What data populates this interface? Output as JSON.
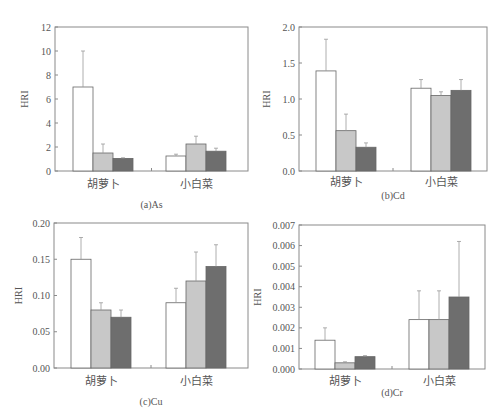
{
  "colors": {
    "series": [
      "#ffffff",
      "#c8c8c8",
      "#6e6e6e"
    ],
    "stroke": "#666666",
    "error": "#999999"
  },
  "chart_data": [
    {
      "type": "bar",
      "title": "(a)As",
      "ylabel": "HRI",
      "xlabel": "",
      "categories": [
        "胡萝卜",
        "小白菜"
      ],
      "ylim": [
        0,
        12
      ],
      "yticks": [
        0,
        2,
        4,
        6,
        8,
        10,
        12
      ],
      "ytick_labels": [
        "0",
        "2",
        "4",
        "6",
        "8",
        "10",
        "12"
      ],
      "series": [
        {
          "name": "series-1",
          "values": [
            7.0,
            1.25
          ],
          "errors": [
            3.0,
            0.15
          ]
        },
        {
          "name": "series-2",
          "values": [
            1.5,
            2.25
          ],
          "errors": [
            0.75,
            0.65
          ]
        },
        {
          "name": "series-3",
          "values": [
            1.05,
            1.65
          ],
          "errors": [
            0.05,
            0.25
          ]
        }
      ],
      "legend": null,
      "grid": false
    },
    {
      "type": "bar",
      "title": "(b)Cd",
      "ylabel": "HRI",
      "xlabel": "",
      "categories": [
        "胡萝卜",
        "小白菜"
      ],
      "ylim": [
        0,
        2.0
      ],
      "yticks": [
        0,
        0.5,
        1.0,
        1.5,
        2.0
      ],
      "ytick_labels": [
        "0.0",
        "0.5",
        "1.0",
        "1.5",
        "2.0"
      ],
      "series": [
        {
          "name": "series-1",
          "values": [
            1.39,
            1.15
          ],
          "errors": [
            0.44,
            0.12
          ]
        },
        {
          "name": "series-2",
          "values": [
            0.56,
            1.05
          ],
          "errors": [
            0.23,
            0.05
          ]
        },
        {
          "name": "series-3",
          "values": [
            0.33,
            1.12
          ],
          "errors": [
            0.06,
            0.15
          ]
        }
      ],
      "legend": null,
      "grid": false
    },
    {
      "type": "bar",
      "title": "(c)Cu",
      "ylabel": "HRI",
      "xlabel": "",
      "categories": [
        "胡萝卜",
        "小白菜"
      ],
      "ylim": [
        0,
        0.2
      ],
      "yticks": [
        0,
        0.05,
        0.1,
        0.15,
        0.2
      ],
      "ytick_labels": [
        "0.00",
        "0.05",
        "0.10",
        "0.15",
        "0.20"
      ],
      "series": [
        {
          "name": "series-1",
          "values": [
            0.15,
            0.09
          ],
          "errors": [
            0.03,
            0.02
          ]
        },
        {
          "name": "series-2",
          "values": [
            0.08,
            0.12
          ],
          "errors": [
            0.01,
            0.04
          ]
        },
        {
          "name": "series-3",
          "values": [
            0.07,
            0.14
          ],
          "errors": [
            0.01,
            0.03
          ]
        }
      ],
      "legend": null,
      "grid": false
    },
    {
      "type": "bar",
      "title": "(d)Cr",
      "ylabel": "HRI",
      "xlabel": "",
      "categories": [
        "胡萝卜",
        "小白菜"
      ],
      "ylim": [
        0,
        0.007
      ],
      "yticks": [
        0,
        0.001,
        0.002,
        0.003,
        0.004,
        0.005,
        0.006,
        0.007
      ],
      "ytick_labels": [
        "0.000",
        "0.001",
        "0.002",
        "0.003",
        "0.004",
        "0.005",
        "0.006",
        "0.007"
      ],
      "series": [
        {
          "name": "series-1",
          "values": [
            0.0014,
            0.0024
          ],
          "errors": [
            0.0006,
            0.0014
          ]
        },
        {
          "name": "series-2",
          "values": [
            0.0003,
            0.0024
          ],
          "errors": [
            5e-05,
            0.0014
          ]
        },
        {
          "name": "series-3",
          "values": [
            0.0006,
            0.0035
          ],
          "errors": [
            5e-05,
            0.0027
          ]
        }
      ],
      "legend": null,
      "grid": false
    }
  ],
  "layout": [
    {
      "left": 55,
      "top": 27,
      "right": 248,
      "bottom": 171,
      "groups": [
        73,
        166
      ],
      "barw": 20,
      "ylabel_x": 28,
      "title_y": 208,
      "cat_y": 188
    },
    {
      "left": 299,
      "top": 27,
      "right": 487,
      "bottom": 171,
      "groups": [
        316,
        411
      ],
      "barw": 20,
      "ylabel_x": 270,
      "title_y": 199,
      "cat_y": 186
    },
    {
      "left": 54,
      "top": 223,
      "right": 248,
      "bottom": 368,
      "groups": [
        71,
        166
      ],
      "barw": 20,
      "ylabel_x": 22,
      "title_y": 405,
      "cat_y": 385
    },
    {
      "left": 299,
      "top": 225,
      "right": 485,
      "bottom": 369,
      "groups": [
        315,
        409
      ],
      "barw": 20,
      "ylabel_x": 261,
      "title_y": 396,
      "cat_y": 385
    }
  ]
}
